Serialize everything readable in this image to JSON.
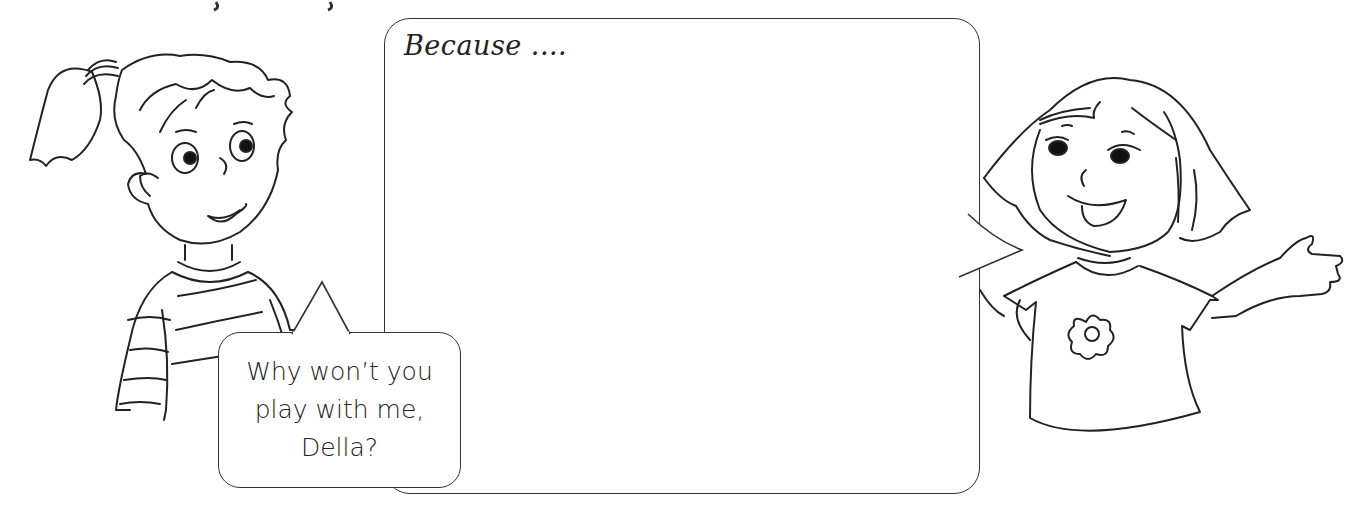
{
  "header": {
    "partial_title_fragment": ""
  },
  "speech_bubbles": {
    "left_girl": {
      "lines": [
        "Why won’t you",
        "play with me,",
        "Della?"
      ]
    },
    "right_girl": {
      "text": "Because ...."
    }
  },
  "characters": {
    "left": {
      "description": "girl with ponytail in striped sweater"
    },
    "right": {
      "description": "girl with bob haircut, flower t-shirt, waving"
    }
  },
  "colors": {
    "line": "#333333",
    "background": "#ffffff"
  }
}
